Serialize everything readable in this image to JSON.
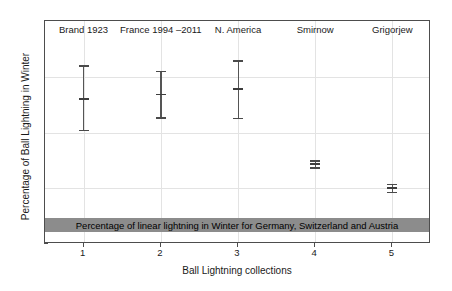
{
  "chart_data": {
    "type": "scatter",
    "title": "",
    "xlabel": "Ball Lightning collections",
    "ylabel": "Percentage of Ball Lightning in Winter",
    "xlim": [
      0.5,
      5.5
    ],
    "ylim": [
      0,
      20
    ],
    "grid": true,
    "legend_position": "none",
    "x": [
      1,
      2,
      3,
      4,
      5
    ],
    "categories": [
      "1",
      "2",
      "3",
      "4",
      "5"
    ],
    "xtick_labels": [
      "1",
      "2",
      "3",
      "4",
      "5"
    ],
    "ytick_labels": [
      "0",
      "5",
      "10",
      "15",
      "20"
    ],
    "ytick_values": [
      0,
      5,
      10,
      15,
      20
    ],
    "series_labels": [
      "Brand 1923",
      "France 1994 –2011",
      "N. America",
      "Smirnow",
      "Grigorjew"
    ],
    "series": [
      {
        "name": "Percentage of Ball Lightning in Winter",
        "values": [
          13.0,
          13.4,
          13.9,
          7.15,
          5.0
        ],
        "err_low": [
          10.1,
          11.25,
          11.2,
          6.75,
          4.55
        ],
        "err_high": [
          16.05,
          15.55,
          16.5,
          7.5,
          5.4
        ]
      }
    ],
    "reference_band": {
      "label": "Percentage of linear lightning in Winter for Germany, Switzerland and Austria",
      "y_low": 1.05,
      "y_high": 2.3,
      "color": "#8c8c8c"
    },
    "colors": {
      "errorbar": "#4a4a4a",
      "axis": "#4d4d4d",
      "grid": "#e3e3e3",
      "band": "#8c8c8c",
      "text": "#1a1a1a"
    }
  }
}
